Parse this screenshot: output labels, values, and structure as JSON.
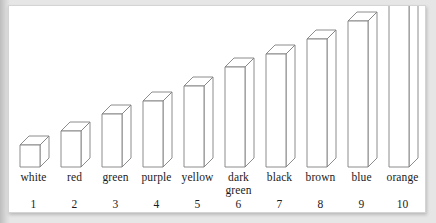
{
  "figure": {
    "background_color": "#ffffff",
    "matte_color": "#e6e6e6",
    "border_color": "#d4d4d4",
    "bar_fill_color": "#ffffff",
    "bar_stroke_color": "#808080",
    "text_color": "#1b1b1b"
  },
  "chart_data": {
    "type": "bar",
    "title": "",
    "subtitle": "",
    "xlabel": "",
    "ylabel": "",
    "grid": false,
    "legend": "none",
    "style": "3d-outline-bars",
    "categories": [
      "white",
      "red",
      "green",
      "purple",
      "yellow",
      "dark green",
      "black",
      "brown",
      "blue",
      "orange"
    ],
    "category_numbers": [
      "1",
      "2",
      "3",
      "4",
      "5",
      "6",
      "7",
      "8",
      "9",
      "10"
    ],
    "values": [
      1,
      2,
      3,
      4,
      5,
      6,
      7,
      8,
      9,
      10
    ],
    "ylim": [
      0,
      10
    ],
    "xlim_labels": [
      "1",
      "10"
    ]
  },
  "bars": [
    {
      "name": "white",
      "number": "1",
      "value": 1,
      "height_px": 22,
      "two_line": false,
      "line1": "white",
      "line2": ""
    },
    {
      "name": "red",
      "number": "2",
      "value": 2,
      "height_px": 36,
      "two_line": false,
      "line1": "red",
      "line2": ""
    },
    {
      "name": "green",
      "number": "3",
      "value": 3,
      "height_px": 53,
      "two_line": false,
      "line1": "green",
      "line2": ""
    },
    {
      "name": "purple",
      "number": "4",
      "value": 4,
      "height_px": 66,
      "two_line": false,
      "line1": "purple",
      "line2": ""
    },
    {
      "name": "yellow",
      "number": "5",
      "value": 5,
      "height_px": 81,
      "two_line": false,
      "line1": "yellow",
      "line2": ""
    },
    {
      "name": "dark green",
      "number": "6",
      "value": 6,
      "height_px": 100,
      "two_line": true,
      "line1": "dark",
      "line2": "green"
    },
    {
      "name": "black",
      "number": "7",
      "value": 7,
      "height_px": 113,
      "two_line": false,
      "line1": "black",
      "line2": ""
    },
    {
      "name": "brown",
      "number": "8",
      "value": 8,
      "height_px": 128,
      "two_line": false,
      "line1": "brown",
      "line2": ""
    },
    {
      "name": "blue",
      "number": "9",
      "value": 9,
      "height_px": 146,
      "two_line": false,
      "line1": "blue",
      "line2": ""
    },
    {
      "name": "orange",
      "number": "10",
      "value": 10,
      "height_px": 162,
      "two_line": false,
      "line1": "orange",
      "line2": ""
    }
  ]
}
